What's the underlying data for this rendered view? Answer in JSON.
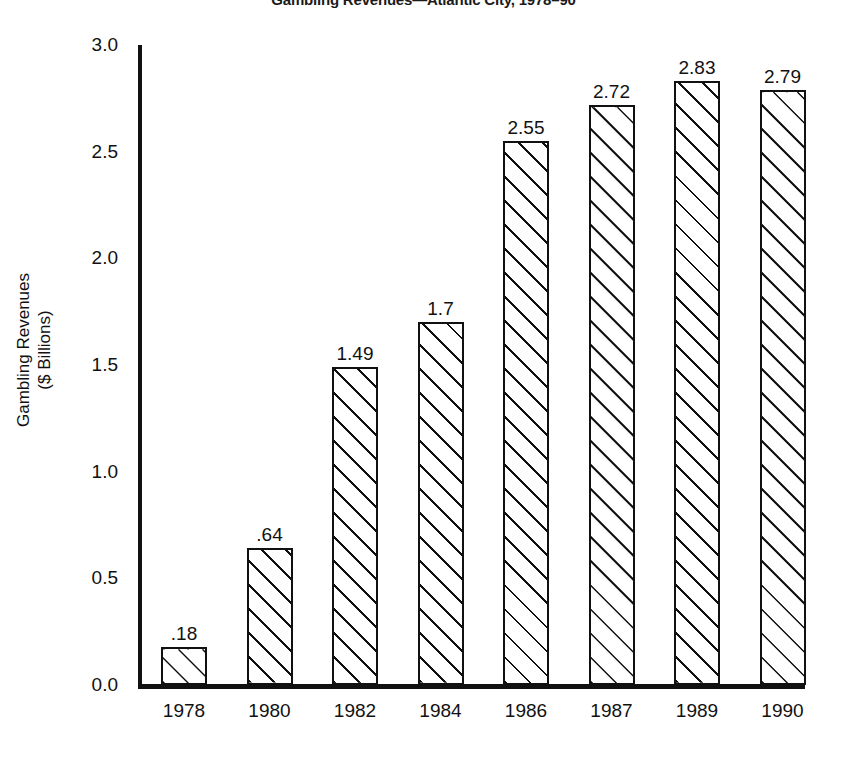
{
  "chart_data": {
    "type": "bar",
    "title": "Gambling Revenues—Atlantic City, 1978–90",
    "xlabel": "",
    "ylabel": "Gambling Revenues\n($ Billions)",
    "ylabel_line1": "Gambling Revenues",
    "ylabel_line2": "($ Billions)",
    "categories": [
      "1978",
      "1980",
      "1982",
      "1984",
      "1986",
      "1987",
      "1989",
      "1990"
    ],
    "values": [
      0.18,
      0.64,
      1.49,
      1.7,
      2.55,
      2.72,
      2.83,
      2.79
    ],
    "value_labels": [
      ".18",
      ".64",
      "1.49",
      "1.7",
      "2.55",
      "2.72",
      "2.83",
      "2.79"
    ],
    "ylim": [
      0.0,
      3.0
    ],
    "yticks": [
      0.0,
      0.5,
      1.0,
      1.5,
      2.0,
      2.5,
      3.0
    ],
    "ytick_labels": [
      "0.0",
      "0.5",
      "1.0",
      "1.5",
      "2.0",
      "2.5",
      "3.0"
    ],
    "grid": false,
    "legend": null,
    "bar_style": {
      "fill": "#ffffff",
      "edge": "#111111",
      "hatch": "diagonal-45"
    }
  },
  "colors": {
    "background": "#ffffff",
    "ink": "#111111"
  }
}
